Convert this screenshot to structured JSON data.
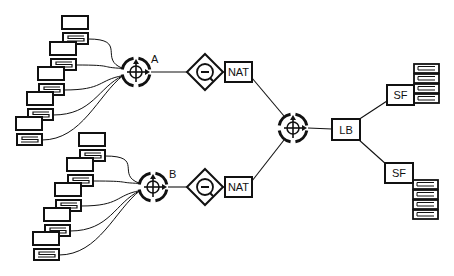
{
  "diagram": {
    "routers": [
      {
        "id": "A",
        "label": "A",
        "cx": 136,
        "cy": 72,
        "lx": 151,
        "ly": 63
      },
      {
        "id": "B",
        "label": "B",
        "cx": 153,
        "cy": 187,
        "lx": 169,
        "ly": 178
      },
      {
        "id": "core",
        "label": "",
        "cx": 293,
        "cy": 128
      }
    ],
    "firewalls": [
      {
        "id": "fwA",
        "cx": 205,
        "cy": 72
      },
      {
        "id": "fwB",
        "cx": 205,
        "cy": 187
      }
    ],
    "nat_boxes": [
      {
        "id": "natA",
        "label": "NAT",
        "x": 225,
        "y": 62,
        "w": 27,
        "h": 20
      },
      {
        "id": "natB",
        "label": "NAT",
        "x": 225,
        "y": 177,
        "w": 27,
        "h": 20
      }
    ],
    "load_balancer": {
      "label": "LB",
      "x": 332,
      "y": 119,
      "w": 28,
      "h": 21
    },
    "servers": [
      {
        "id": "sf1",
        "label": "SF",
        "x": 387,
        "y": 85,
        "w": 27,
        "h": 20,
        "stack_x": 414,
        "stack_y": 64
      },
      {
        "id": "sf2",
        "label": "SF",
        "x": 385,
        "y": 163,
        "w": 28,
        "h": 20,
        "stack_x": 413,
        "stack_y": 180
      }
    ],
    "workstation_groups": [
      {
        "router": "A",
        "hosts": [
          [
            62,
            16
          ],
          [
            50,
            42
          ],
          [
            38,
            67
          ],
          [
            27,
            92
          ],
          [
            16,
            117
          ]
        ]
      },
      {
        "router": "B",
        "hosts": [
          [
            79,
            133
          ],
          [
            67,
            158
          ],
          [
            55,
            183
          ],
          [
            44,
            208
          ],
          [
            33,
            232
          ]
        ]
      }
    ]
  }
}
